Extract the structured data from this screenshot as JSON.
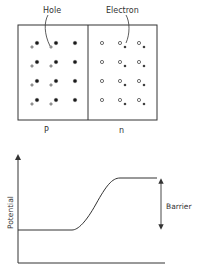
{
  "labels": {
    "hole": "Hole",
    "electron": "Electron",
    "p_region": "P",
    "n_region": "n",
    "y_axis": "Potential",
    "barrier": "Barrier"
  },
  "colors": {
    "stroke": "#333333",
    "dot_fill": "#1a1a1a",
    "hole_fill": "#ffffff",
    "background": "#ffffff"
  },
  "crystal": {
    "box": {
      "x": 18,
      "y": 25,
      "width": 139,
      "height": 95
    },
    "divider_x": 88,
    "rows_y": [
      43,
      62,
      81,
      100
    ],
    "p_side": {
      "acceptor_cols_x": [
        37,
        56,
        75
      ],
      "hole_offset": {
        "dx": -5,
        "dy": 4
      },
      "holes_per_row_cols": [
        0,
        1
      ]
    },
    "n_side": {
      "donor_cols_x": [
        102,
        120,
        139
      ],
      "electron_offset": {
        "dx": 5,
        "dy": 4
      },
      "electrons_per_row_cols": [
        1,
        2
      ]
    }
  },
  "graph": {
    "y_axis": {
      "x": 18,
      "y_top": 155,
      "y_bottom": 263
    },
    "x_axis": {
      "y": 263,
      "x_left": 18,
      "x_right": 165
    },
    "curve": {
      "low_y": 230,
      "high_y": 178,
      "x_start": 18,
      "x_rise_start": 72,
      "x_rise_end": 120,
      "x_end": 157
    },
    "barrier_arrow": {
      "x": 161,
      "y_top": 180,
      "y_bottom": 228
    }
  }
}
